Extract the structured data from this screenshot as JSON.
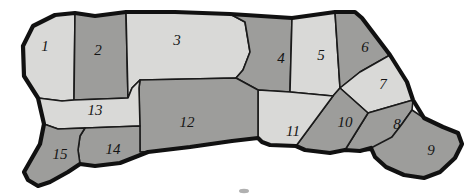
{
  "figure": {
    "type": "anatomical-cut-diagram",
    "orientation": "facing-left",
    "background_color": "#ffffff",
    "outline_color": "#111111",
    "fill_light": "#d9d9d7",
    "fill_dark": "#9d9d9b",
    "label_count": 15
  },
  "regions": [
    {
      "id": "region-1",
      "label": "1",
      "shade": "light",
      "label_x": 45,
      "label_y": 48
    },
    {
      "id": "region-2",
      "label": "2",
      "shade": "dark",
      "label_x": 98,
      "label_y": 52
    },
    {
      "id": "region-3",
      "label": "3",
      "shade": "light",
      "label_x": 177,
      "label_y": 42
    },
    {
      "id": "region-4",
      "label": "4",
      "shade": "dark",
      "label_x": 281,
      "label_y": 60
    },
    {
      "id": "region-5",
      "label": "5",
      "shade": "light",
      "label_x": 321,
      "label_y": 57
    },
    {
      "id": "region-6",
      "label": "6",
      "shade": "dark",
      "label_x": 365,
      "label_y": 49
    },
    {
      "id": "region-7",
      "label": "7",
      "shade": "light",
      "label_x": 383,
      "label_y": 86
    },
    {
      "id": "region-8",
      "label": "8",
      "shade": "dark",
      "label_x": 397,
      "label_y": 126
    },
    {
      "id": "region-9",
      "label": "9",
      "shade": "dark",
      "label_x": 431,
      "label_y": 152
    },
    {
      "id": "region-10",
      "label": "10",
      "shade": "dark",
      "label_x": 345,
      "label_y": 124
    },
    {
      "id": "region-11",
      "label": "11",
      "shade": "light",
      "label_x": 293,
      "label_y": 133
    },
    {
      "id": "region-12",
      "label": "12",
      "shade": "dark",
      "label_x": 187,
      "label_y": 124
    },
    {
      "id": "region-13",
      "label": "13",
      "shade": "light",
      "label_x": 95,
      "label_y": 112
    },
    {
      "id": "region-14",
      "label": "14",
      "shade": "dark",
      "label_x": 113,
      "label_y": 151
    },
    {
      "id": "region-15",
      "label": "15",
      "shade": "dark",
      "label_x": 60,
      "label_y": 156
    }
  ]
}
